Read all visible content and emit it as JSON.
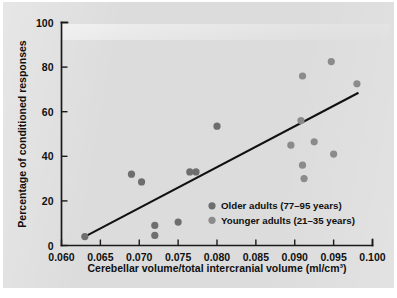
{
  "figure": {
    "name": "cerebellar-volume-vs-conditioned-responses-scatter",
    "background_color": "#dcdcdc",
    "ink_color": "#101010"
  },
  "chart_data": {
    "type": "scatter",
    "title": "",
    "xlabel": "Cerebellar volume/total intercranial volume (ml/cm³)",
    "ylabel": "Percentage of conditioned responses",
    "xlim": [
      0.06,
      0.1
    ],
    "ylim": [
      0,
      100
    ],
    "xticks": [
      0.06,
      0.065,
      0.07,
      0.075,
      0.08,
      0.085,
      0.09,
      0.095,
      0.1
    ],
    "xtick_labels": [
      "0.060",
      "0.065",
      "0.070",
      "0.075",
      "0.080",
      "0.085",
      "0.090",
      "0.095",
      "0.100"
    ],
    "yticks": [
      0,
      20,
      40,
      60,
      80,
      100
    ],
    "ytick_labels": [
      "0",
      "20",
      "40",
      "60",
      "80",
      "100"
    ],
    "grid": false,
    "legend_position": "center-right-lower",
    "series": [
      {
        "name": "Older adults (77–95 years)",
        "color": "#6e6e6e",
        "marker": "circle",
        "points": [
          {
            "x": 0.063,
            "y": 4.0
          },
          {
            "x": 0.069,
            "y": 32.0
          },
          {
            "x": 0.0703,
            "y": 28.5
          },
          {
            "x": 0.072,
            "y": 9.0
          },
          {
            "x": 0.072,
            "y": 4.5
          },
          {
            "x": 0.075,
            "y": 10.5
          },
          {
            "x": 0.0765,
            "y": 33.0
          },
          {
            "x": 0.0773,
            "y": 33.0
          },
          {
            "x": 0.08,
            "y": 53.5
          }
        ]
      },
      {
        "name": "Younger adults (21–35 years)",
        "color": "#8b8b8b",
        "marker": "circle",
        "points": [
          {
            "x": 0.0895,
            "y": 45.0
          },
          {
            "x": 0.0908,
            "y": 56.0
          },
          {
            "x": 0.091,
            "y": 76.0
          },
          {
            "x": 0.091,
            "y": 36.0
          },
          {
            "x": 0.0912,
            "y": 30.0
          },
          {
            "x": 0.0925,
            "y": 46.5
          },
          {
            "x": 0.0947,
            "y": 82.5
          },
          {
            "x": 0.095,
            "y": 41.0
          },
          {
            "x": 0.098,
            "y": 72.5
          }
        ]
      }
    ],
    "fit_line": {
      "name": "linear regression line",
      "color": "#111111",
      "x_start": 0.063,
      "y_start": 4.0,
      "x_end": 0.0982,
      "y_end": 68.5
    },
    "legend_entries": [
      {
        "label": "Older adults (77–95 years)",
        "color": "#6e6e6e"
      },
      {
        "label": "Younger adults (21–35 years)",
        "color": "#8b8b8b"
      }
    ]
  }
}
